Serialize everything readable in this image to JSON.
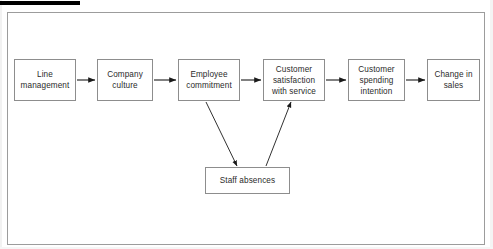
{
  "canvas": {
    "width": 493,
    "height": 249,
    "background": "#ffffff"
  },
  "markers": {
    "top_black_bar": {
      "color": "#000000",
      "x": 0,
      "y": 1,
      "width": 80,
      "height": 4
    }
  },
  "frame": {
    "border_color": "#9c9c9c",
    "fill": "#ffffff",
    "x": 7,
    "y": 12,
    "width": 478,
    "height": 233
  },
  "diagram": {
    "type": "flowchart",
    "orientation": "left-to-right",
    "node_border_color": "#8d8d8d",
    "node_fill": "#ffffff",
    "text_color": "#2b2b2b",
    "arrow_color": "#1a1a1a",
    "nodes": [
      {
        "id": "line-management",
        "label": "Line\nmanagement",
        "x": 14,
        "y": 59,
        "width": 62,
        "height": 42,
        "row": "main"
      },
      {
        "id": "company-culture",
        "label": "Company\nculture",
        "x": 97,
        "y": 59,
        "width": 56,
        "height": 42,
        "row": "main"
      },
      {
        "id": "employee-commitment",
        "label": "Employee\ncommitment",
        "x": 178,
        "y": 59,
        "width": 62,
        "height": 42,
        "row": "main"
      },
      {
        "id": "customer-satisfaction-with-service",
        "label": "Customer\nsatisfaction\nwith service",
        "x": 263,
        "y": 59,
        "width": 62,
        "height": 42,
        "row": "main"
      },
      {
        "id": "customer-spending-intention",
        "label": "Customer\nspending\nintention",
        "x": 348,
        "y": 59,
        "width": 57,
        "height": 42,
        "row": "main"
      },
      {
        "id": "change-in-sales",
        "label": "Change in\nsales",
        "x": 427,
        "y": 59,
        "width": 53,
        "height": 42,
        "row": "main"
      },
      {
        "id": "staff-absences",
        "label": "Staff absences",
        "x": 205,
        "y": 167,
        "width": 85,
        "height": 27,
        "row": "lower"
      }
    ],
    "edges": [
      {
        "id": "edge-line-management-company-culture",
        "from": "line-management",
        "to": "company-culture",
        "kind": "horizontal",
        "x1": 77,
        "y1": 80,
        "x2": 95,
        "y2": 80
      },
      {
        "id": "edge-company-culture-employee-commitment",
        "from": "company-culture",
        "to": "employee-commitment",
        "kind": "horizontal",
        "x1": 154,
        "y1": 80,
        "x2": 176,
        "y2": 80
      },
      {
        "id": "edge-employee-commitment-customer-satisfaction",
        "from": "employee-commitment",
        "to": "customer-satisfaction-with-service",
        "kind": "horizontal",
        "x1": 241,
        "y1": 80,
        "x2": 261,
        "y2": 80
      },
      {
        "id": "edge-customer-satisfaction-customer-spending",
        "from": "customer-satisfaction-with-service",
        "to": "customer-spending-intention",
        "kind": "horizontal",
        "x1": 326,
        "y1": 80,
        "x2": 346,
        "y2": 80
      },
      {
        "id": "edge-customer-spending-change-in-sales",
        "from": "customer-spending-intention",
        "to": "change-in-sales",
        "kind": "horizontal",
        "x1": 406,
        "y1": 80,
        "x2": 425,
        "y2": 80
      },
      {
        "id": "edge-employee-commitment-staff-absences",
        "from": "employee-commitment",
        "to": "staff-absences",
        "kind": "diagonal-down-right",
        "x1": 206,
        "y1": 102,
        "x2": 237,
        "y2": 166
      },
      {
        "id": "edge-staff-absences-customer-satisfaction",
        "from": "staff-absences",
        "to": "customer-satisfaction-with-service",
        "kind": "diagonal-up-right",
        "x1": 266,
        "y1": 166,
        "x2": 291,
        "y2": 102
      }
    ]
  }
}
